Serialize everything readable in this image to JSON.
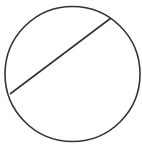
{
  "diagram": {
    "stroke_color": "#333333",
    "background": "#ffffff",
    "circle": {
      "cx": 72.5,
      "cy": 74,
      "r": 67.5
    },
    "chord": {
      "x1": 10,
      "y1": 94,
      "x2": 111,
      "y2": 18
    }
  }
}
